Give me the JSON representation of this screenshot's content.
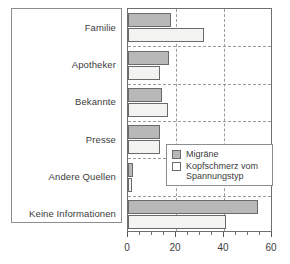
{
  "chart_data": {
    "type": "bar",
    "orientation": "horizontal",
    "title": "",
    "xlabel": "",
    "ylabel": "",
    "xlim": [
      0,
      60
    ],
    "xticks": [
      0,
      20,
      40,
      60
    ],
    "xtick_labels": [
      "0",
      "20",
      "40",
      "60"
    ],
    "minor_tick_step": 5,
    "grid": true,
    "grid_style": "dashed",
    "legend_position": "center-right",
    "categories": [
      "Familie",
      "Apotheker",
      "Bekannte",
      "Presse",
      "Andere Quellen",
      "Keine Informationen"
    ],
    "series": [
      {
        "name": "Migräne",
        "color": "#b8b8b8",
        "values": [
          18,
          17,
          14,
          13.5,
          2,
          54
        ]
      },
      {
        "name": "Kopfschmerz vom Spannungstyp",
        "color": "#f3f3f1",
        "values": [
          31.5,
          13.5,
          16.5,
          13.5,
          1.5,
          41
        ]
      }
    ]
  },
  "legend": {
    "entries": [
      {
        "label": "Migräne"
      },
      {
        "label": "Kopfschmerz vom\nSpannungstyp"
      }
    ]
  },
  "colors": {
    "series_a": "#b8b8b8",
    "series_b": "#f3f3f1",
    "axis": "#6f6f6f",
    "grid": "#9a9a9a",
    "text": "#3c3c3c"
  }
}
